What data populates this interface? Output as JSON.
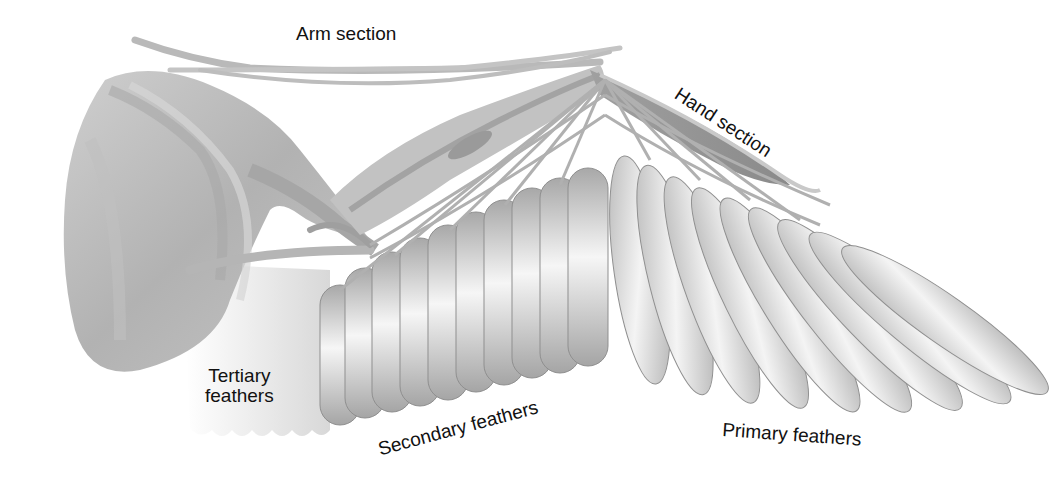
{
  "diagram": {
    "labels": {
      "arm_section": "Arm section",
      "hand_section": "Hand section",
      "tertiary_feathers_line1": "Tertiary",
      "tertiary_feathers_line2": "feathers",
      "secondary_feathers": "Secondary feathers",
      "primary_feathers": "Primary feathers"
    },
    "colors": {
      "background": "#ffffff",
      "feather_light": "#f4f4f4",
      "feather_mid": "#c8c8c8",
      "feather_dark": "#9a9a9a",
      "muscle": "#b5b5b5",
      "label_text": "#111111"
    }
  }
}
